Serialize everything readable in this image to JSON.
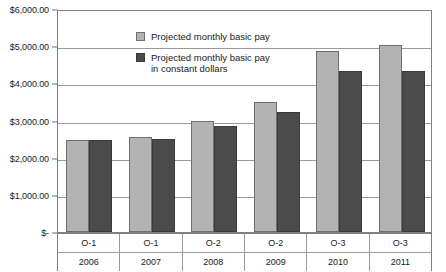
{
  "chart_data": {
    "type": "bar",
    "title": "",
    "xlabel": "",
    "ylabel": "",
    "ylim": [
      0,
      6000
    ],
    "ytick_values": [
      6000,
      5000,
      4000,
      3000,
      2000,
      1000,
      0
    ],
    "ytick_labels": [
      "$6,000.00",
      "$5,000.00",
      "$4,000.00",
      "$3,000.00",
      "$2,000.00",
      "$1,000.00",
      "$-"
    ],
    "grid": true,
    "legend_position": "upper-left-inside",
    "categories": [
      "O-1",
      "O-1",
      "O-2",
      "O-2",
      "O-3",
      "O-3"
    ],
    "category_sublabels": [
      "2006",
      "2007",
      "2008",
      "2009",
      "2010",
      "2011"
    ],
    "series": [
      {
        "name": "Projected monthly basic pay",
        "color": "#b3b3b3",
        "values": [
          2480,
          2560,
          3000,
          3500,
          4880,
          5040
        ]
      },
      {
        "name": "Projected monthly basic pay in constant dollars",
        "color": "#4b4b4b",
        "values": [
          2480,
          2490,
          2840,
          3230,
          4340,
          4340
        ]
      }
    ]
  },
  "legend": {
    "entries": [
      {
        "label": "Projected monthly basic pay",
        "swatch": "light"
      },
      {
        "label": "Projected monthly basic pay\nin constant dollars",
        "swatch": "dark"
      }
    ]
  }
}
